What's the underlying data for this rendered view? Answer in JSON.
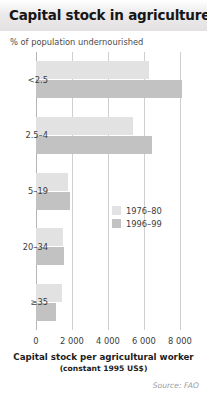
{
  "header": {
    "title": "Capital stock in agriculture"
  },
  "subtitle": "% of population undernourished",
  "source": "Source: FAO",
  "legend": {
    "position": "inside-center",
    "entries": [
      {
        "label": "1976–80",
        "color": "#e2e2e2"
      },
      {
        "label": "1996–99",
        "color": "#c2c2c2"
      }
    ]
  },
  "chart_data": {
    "type": "bar",
    "orientation": "horizontal",
    "title": "Capital stock in agriculture",
    "subtitle": "% of population undernourished",
    "xlabel": "Capital stock per agricultural worker",
    "xlabel_sub": "(constant 1995 US$)",
    "ylabel": "% of population undernourished",
    "categories": [
      "<2.5",
      "2.5–4",
      "5–19",
      "20–34",
      "≥35"
    ],
    "series": [
      {
        "name": "1976–80",
        "color": "#e2e2e2",
        "values": [
          6300,
          5400,
          1750,
          1500,
          1450
        ]
      },
      {
        "name": "1996–99",
        "color": "#c2c2c2",
        "values": [
          8100,
          6450,
          1900,
          1550,
          1100
        ]
      }
    ],
    "xlim": [
      0,
      8400
    ],
    "xticks": [
      0,
      2000,
      4000,
      6000,
      8000
    ],
    "xtick_labels": [
      "0",
      "2 000",
      "4 000",
      "6 000",
      "8 000"
    ],
    "grid": "vertical",
    "source": "Source: FAO"
  }
}
